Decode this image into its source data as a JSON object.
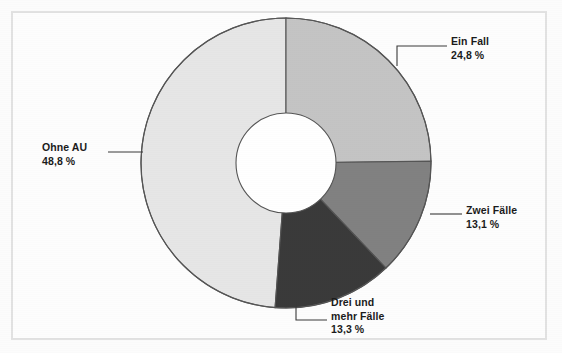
{
  "figure": {
    "background_color": "#fdfdfd",
    "frame_color": "#e2e2e2"
  },
  "chart_data": {
    "type": "pie",
    "variant": "donut",
    "title": "",
    "subtitle": "",
    "xlabel": "",
    "ylabel": "",
    "legend_position": "none",
    "grid": false,
    "start_angle_deg": 0,
    "direction": "clockwise",
    "inner_radius_ratio": 0.345,
    "value_unit": "%",
    "decimal_separator": ",",
    "categories": [
      "Ein Fall",
      "Zwei Fälle",
      "Drei und mehr Fälle",
      "Ohne AU"
    ],
    "values": [
      24.8,
      13.1,
      13.3,
      48.8
    ],
    "value_labels": [
      "24,8 %",
      "13,1 %",
      "13,3 %",
      "48,8 %"
    ],
    "colors": [
      "#c4c4c4",
      "#818181",
      "#3a3a3a",
      "#e6e6e6"
    ],
    "slices": [
      {
        "name": "Ein Fall",
        "value": 24.8,
        "value_label": "24,8 %",
        "color": "#c4c4c4",
        "start_angle_deg": 0.0,
        "end_angle_deg": 89.28
      },
      {
        "name": "Zwei Fälle",
        "value": 13.1,
        "value_label": "13,1 %",
        "color": "#818181",
        "start_angle_deg": 89.28,
        "end_angle_deg": 136.44
      },
      {
        "name": "Drei und mehr Fälle",
        "value": 13.3,
        "value_label": "13,3 %",
        "color": "#3a3a3a",
        "start_angle_deg": 136.44,
        "end_angle_deg": 184.32
      },
      {
        "name": "Ohne AU",
        "value": 48.8,
        "value_label": "48,8 %",
        "color": "#e6e6e6",
        "start_angle_deg": 184.32,
        "end_angle_deg": 360.0
      }
    ]
  },
  "labels": {
    "ein_fall": {
      "line1": "Ein Fall",
      "line2": "24,8 %"
    },
    "zwei_faelle": {
      "line1": "Zwei Fälle",
      "line2": "13,1 %"
    },
    "drei_mehr": {
      "line1": "Drei und",
      "line2": "mehr Fälle",
      "line3": "13,3 %"
    },
    "ohne_au": {
      "line1": "Ohne AU",
      "line2": "48,8 %"
    }
  }
}
